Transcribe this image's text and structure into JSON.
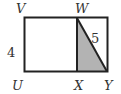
{
  "diagram": {
    "type": "geometry",
    "shape": "rectangle UVWY with segment WX and diagonal WY",
    "vertices": {
      "U": "U",
      "V": "V",
      "W": "W",
      "X": "X",
      "Y": "Y"
    },
    "labels": {
      "side_UV": "4",
      "segment_WY": "5"
    },
    "shaded_region": "triangle WXY",
    "colors": {
      "stroke": "#222222",
      "shade": "#b3b3b3"
    }
  }
}
